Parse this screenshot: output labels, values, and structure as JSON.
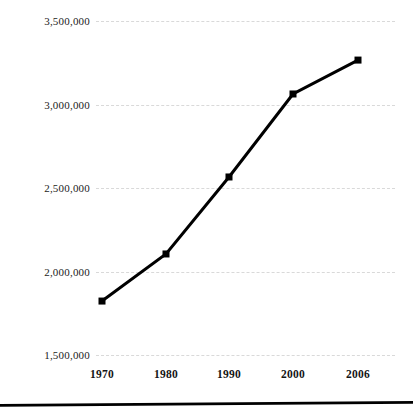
{
  "chart_data": {
    "type": "line",
    "title": "",
    "subtitle": "",
    "xlabel": "",
    "ylabel": "",
    "categories": [
      "1970",
      "1980",
      "1990",
      "2000",
      "2006"
    ],
    "x": [
      1970,
      1980,
      1990,
      2000,
      2006
    ],
    "values": [
      1823000,
      2105000,
      2566000,
      3063000,
      3266000
    ],
    "series": [
      {
        "name": "Population",
        "values": [
          1823000,
          2105000,
          2566000,
          3063000,
          3266000
        ]
      }
    ],
    "ylim": [
      1500000,
      3500000
    ],
    "ytick_values": [
      1500000,
      2000000,
      2500000,
      3000000,
      3500000
    ],
    "ytick_labels": [
      "1,500,000",
      "2,000,000",
      "2,500,000",
      "3,000,000",
      "3,500,000"
    ],
    "xtick_labels": [
      "1970",
      "1980",
      "1990",
      "2000",
      "2006"
    ],
    "grid": true,
    "grid_axis": "y",
    "grid_style": "dashed",
    "legend": false,
    "legend_position": "none",
    "annotations": [],
    "colors": {
      "line": "#000000",
      "marker": "#000000",
      "gridline": "#d9d9d9",
      "text": "#151515",
      "background": "#ffffff",
      "rule": "#000000"
    },
    "marker_shape": "square",
    "line_width": 3
  },
  "axes": {
    "y_labels": [
      {
        "text": "3,500,000",
        "value": 3500000
      },
      {
        "text": "3,000,000",
        "value": 3000000
      },
      {
        "text": "2,500,000",
        "value": 2500000
      },
      {
        "text": "2,000,000",
        "value": 2000000
      },
      {
        "text": "1,500,000",
        "value": 1500000
      }
    ],
    "x_labels": [
      {
        "text": "1970"
      },
      {
        "text": "1980"
      },
      {
        "text": "1990"
      },
      {
        "text": "2000"
      },
      {
        "text": "2006"
      }
    ]
  }
}
